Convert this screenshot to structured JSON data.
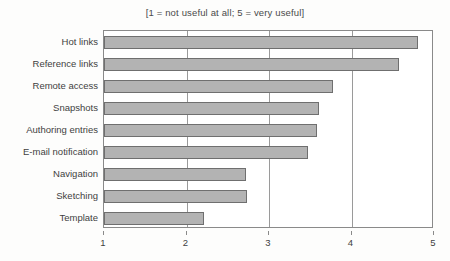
{
  "chart_data": {
    "type": "bar",
    "orientation": "horizontal",
    "title": "[1 = not useful at all; 5 = very useful]",
    "xlabel": "",
    "ylabel": "",
    "xlim": [
      1,
      5
    ],
    "xticks": [
      "1",
      "2",
      "3",
      "4",
      "5"
    ],
    "xtick_values": [
      1,
      2,
      3,
      4,
      5
    ],
    "grid": true,
    "grid_axis": "x",
    "legend": null,
    "categories": [
      "Hot links",
      "Reference links",
      "Remote access",
      "Snapshots",
      "Authoring entries",
      "E-mail notification",
      "Navigation",
      "Sketching",
      "Template"
    ],
    "values": [
      4.81,
      4.58,
      3.78,
      3.6,
      3.58,
      3.47,
      2.72,
      2.73,
      2.21
    ],
    "bar_fill_color": "#b3b3b3",
    "bar_edge_color": "#6f6f6f",
    "axis_color": "#8a8a8a",
    "background_color": "#ffffff"
  }
}
